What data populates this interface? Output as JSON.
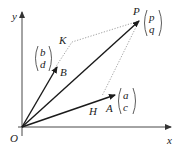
{
  "diagram": {
    "type": "vector-parallelogram",
    "axes": {
      "x_label": "x",
      "y_label": "y",
      "origin_label": "O"
    },
    "points": {
      "O": {
        "label": "O"
      },
      "A": {
        "label": "A",
        "vector_top": "a",
        "vector_bottom": "c"
      },
      "B": {
        "label": "B",
        "vector_top": "b",
        "vector_bottom": "d"
      },
      "P": {
        "label": "P",
        "vector_top": "p",
        "vector_bottom": "q"
      },
      "H": {
        "label": "H"
      },
      "K": {
        "label": "K"
      }
    },
    "colors": {
      "vector": "#1a1a1a",
      "dotted": "#777777",
      "axis": "#333333"
    }
  }
}
